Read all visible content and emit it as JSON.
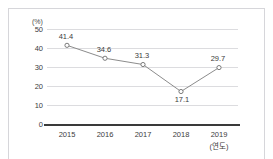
{
  "top_caption": "",
  "chart_data": {
    "type": "line",
    "title": "",
    "xlabel": "(연도)",
    "ylabel": "(%)",
    "categories": [
      "2015",
      "2016",
      "2017",
      "2018",
      "2019"
    ],
    "values": [
      41.4,
      34.6,
      31.3,
      17.1,
      29.7
    ],
    "point_labels": [
      "41.4",
      "34.6",
      "31.3",
      "17.1",
      "29.7"
    ],
    "point_label_positions": [
      "above",
      "above",
      "above",
      "below",
      "above"
    ],
    "ylim": [
      0,
      50
    ],
    "yticks": [
      "0",
      "10",
      "20",
      "30",
      "40",
      "50"
    ],
    "grid": true,
    "legend": "none",
    "series_color": "#8c8c8c",
    "marker": "open-circle",
    "marker_color": "#ffffff",
    "marker_edge_color": "#6e6e6e",
    "gridline_color": "#dcdcdf",
    "axis_color": "#3a3a3a",
    "text_color": "#3c3c3c",
    "frame_color": "#d6d6da"
  }
}
